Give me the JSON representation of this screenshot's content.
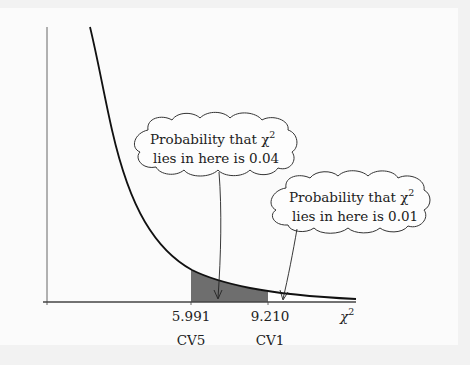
{
  "figure": {
    "x_axis_label": "χ",
    "x_axis_label_sup": "2",
    "ticks": [
      {
        "value": "5.991",
        "name": "CV5"
      },
      {
        "value": "9.210",
        "name": "CV1"
      }
    ],
    "callouts": [
      {
        "line1": "Probability that χ",
        "line1_sup": "2",
        "line2": "lies in here is 0.04"
      },
      {
        "line1": "Probability that χ",
        "line1_sup": "2",
        "line2": "lies in here is 0.01"
      }
    ],
    "colors": {
      "curve": "#111111",
      "shade_cv5_cv1": "#6e6e6e",
      "shade_tail": "#ffffff",
      "axis": "#555555",
      "background": "#fbfbfb"
    }
  }
}
